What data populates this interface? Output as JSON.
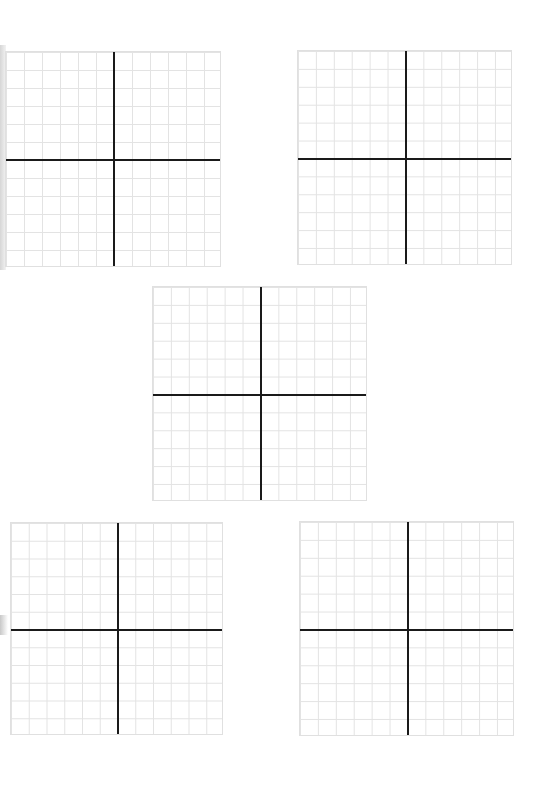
{
  "page": {
    "background": "#ffffff",
    "grid_line_color": "#e3e3e3",
    "axis_color": "#1a1a1a"
  },
  "planes": [
    {
      "id": "top-left",
      "x": 5,
      "y": 51,
      "size": 216,
      "cells": 12,
      "origin_col": 6,
      "origin_row": 6
    },
    {
      "id": "top-right",
      "x": 297,
      "y": 50,
      "size": 215,
      "cells": 12,
      "origin_col": 6,
      "origin_row": 6
    },
    {
      "id": "center",
      "x": 152,
      "y": 286,
      "size": 215,
      "cells": 12,
      "origin_col": 6,
      "origin_row": 6
    },
    {
      "id": "bottom-left",
      "x": 10,
      "y": 522,
      "size": 213,
      "cells": 12,
      "origin_col": 6,
      "origin_row": 6
    },
    {
      "id": "bottom-right",
      "x": 299,
      "y": 521,
      "size": 215,
      "cells": 12,
      "origin_col": 6,
      "origin_row": 6
    }
  ]
}
